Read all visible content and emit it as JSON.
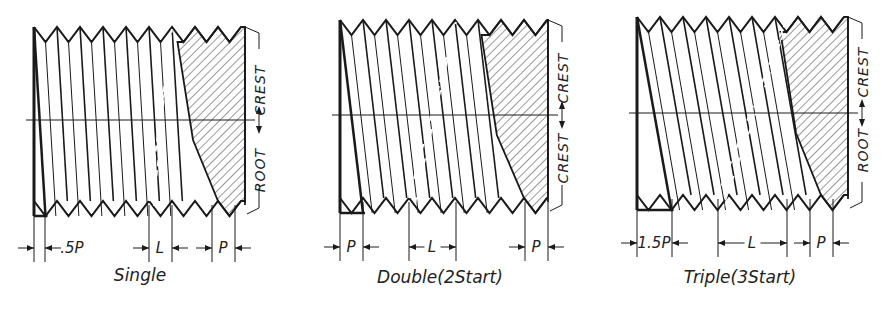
{
  "figure": {
    "line_color": "#1a1a1a",
    "background": "#ffffff"
  },
  "panels": [
    {
      "id": "single",
      "caption": "Single",
      "starts": 1,
      "left": 34,
      "right": 245,
      "top": 27,
      "bottom": 216,
      "pitch": 23,
      "depth": 15,
      "center_y": 120,
      "side_labels": {
        "upper": "CREST",
        "lower": "ROOT"
      },
      "dimensions": [
        {
          "label": ".5P",
          "x1": 34,
          "x2": 45,
          "arrows": "outside"
        },
        {
          "label": "L",
          "x1": 149,
          "x2": 172,
          "arrows": "outside"
        },
        {
          "label": "P",
          "x1": 212,
          "x2": 235,
          "arrows": "outside"
        }
      ],
      "caption_x": 140,
      "caption_y": 281,
      "dim_y": 248
    },
    {
      "id": "double",
      "caption": "Double(2Start)",
      "starts": 2,
      "left": 340,
      "right": 548,
      "top": 20,
      "bottom": 213,
      "pitch": 23,
      "depth": 15,
      "center_y": 115,
      "side_labels": {
        "upper": "CREST",
        "lower": "CREST"
      },
      "dimensions": [
        {
          "label": "P",
          "x1": 340,
          "x2": 363,
          "arrows": "outside"
        },
        {
          "label": "L",
          "x1": 409,
          "x2": 456,
          "arrows": "inside"
        },
        {
          "label": "P",
          "x1": 525,
          "x2": 548,
          "arrows": "outside"
        }
      ],
      "caption_x": 440,
      "caption_y": 283,
      "dim_y": 247
    },
    {
      "id": "triple",
      "caption": "Triple(3Start)",
      "starts": 3,
      "left": 637,
      "right": 848,
      "top": 17,
      "bottom": 210,
      "pitch": 23,
      "depth": 15,
      "center_y": 113,
      "side_labels": {
        "upper": "CREST",
        "lower": "ROOT"
      },
      "dimensions": [
        {
          "label": "1.5P",
          "x1": 637,
          "x2": 672,
          "arrows": "outside"
        },
        {
          "label": "L",
          "x1": 718,
          "x2": 787,
          "arrows": "inside"
        },
        {
          "label": "P",
          "x1": 810,
          "x2": 833,
          "arrows": "outside"
        }
      ],
      "caption_x": 740,
      "caption_y": 283,
      "dim_y": 243
    }
  ]
}
